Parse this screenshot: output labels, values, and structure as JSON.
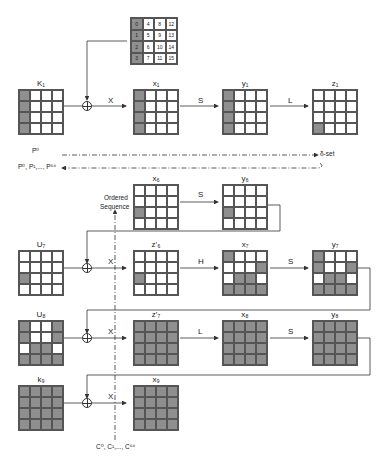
{
  "ordering_grid": {
    "name": "byte-index-grid",
    "values": [
      [
        0,
        4,
        8,
        12
      ],
      [
        1,
        5,
        9,
        13
      ],
      [
        2,
        6,
        10,
        14
      ],
      [
        3,
        7,
        11,
        15
      ]
    ],
    "shaded_column": 0
  },
  "rows": [
    {
      "id": "round-1",
      "states": [
        {
          "label": "K₁",
          "pattern": "1000100010001000"
        },
        {
          "label": "x₁",
          "pattern": "1000100010001000"
        },
        {
          "label": "y₁",
          "pattern": "1000100010001000"
        },
        {
          "label": "z₁",
          "pattern": "0000000000001000"
        }
      ],
      "ops": [
        "X",
        "S",
        "L"
      ]
    },
    {
      "id": "round-6",
      "states": [
        {
          "label": "x₆",
          "pattern": "0000000010000000"
        },
        {
          "label": "y₆",
          "pattern": "0000000010000000"
        }
      ],
      "ops": [
        "S"
      ]
    },
    {
      "id": "round-7",
      "states": [
        {
          "label": "U₇",
          "pattern": "0000000010000000"
        },
        {
          "label": "z'₆",
          "pattern": "0000000010000000"
        },
        {
          "label": "x₇",
          "pattern": "1000000101101111"
        },
        {
          "label": "y₇",
          "pattern": "1000100101101111"
        }
      ],
      "ops": [
        "X",
        "H",
        "S"
      ]
    },
    {
      "id": "round-8",
      "states": [
        {
          "label": "U₈",
          "pattern": "1001100101101111"
        },
        {
          "label": "z'₇",
          "pattern": "1111111111111111"
        },
        {
          "label": "x₈",
          "pattern": "1111111111111111"
        },
        {
          "label": "y₈",
          "pattern": "1111111111111111"
        }
      ],
      "ops": [
        "X",
        "L",
        "S"
      ]
    },
    {
      "id": "round-9",
      "states": [
        {
          "label": "k₉",
          "pattern": "1111111111111111"
        },
        {
          "label": "x₉",
          "pattern": "1111111111111111"
        }
      ],
      "ops": [
        "X"
      ]
    }
  ],
  "annotations": {
    "p0": "P⁰",
    "plist": "P⁰, P¹,..., P⁶⁴",
    "delta_set": "δ-set",
    "ordered_line1": "Ordered",
    "ordered_line2": "Sequence",
    "clist": "C⁰, C¹,..., C⁶⁴"
  },
  "colors": {
    "shaded": "#8f8f8f",
    "line": "#333333",
    "background": "#ffffff"
  }
}
